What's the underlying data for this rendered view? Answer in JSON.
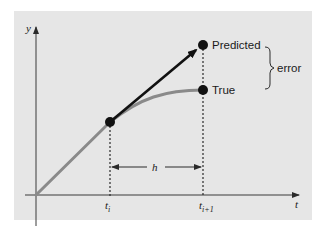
{
  "diagram": {
    "type": "euler-method-error-illustration",
    "axes": {
      "y_label": "y",
      "x_label": "t"
    },
    "ticks": [
      {
        "main": "t",
        "sub": "i"
      },
      {
        "main": "t",
        "sub": "i+1"
      }
    ],
    "step_label": "h",
    "points": {
      "predicted_label": "Predicted",
      "true_label": "True"
    },
    "error_label": "error",
    "colors": {
      "panel": "#e6e6e6",
      "true_curve": "#8a8a8a",
      "predicted_line": "#111111"
    }
  }
}
